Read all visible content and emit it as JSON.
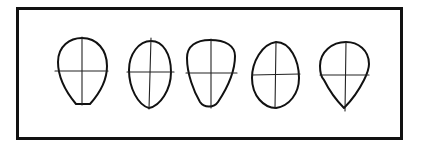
{
  "figure": {
    "frame_color": "#111111",
    "stroke_color": "#111111",
    "background": "#ffffff",
    "shapes": [
      {
        "index": 1,
        "name": "flat-bottom-oval",
        "label": "Oval with flat chin"
      },
      {
        "index": 2,
        "name": "egg-narrow-bottom",
        "label": "Egg shape (narrow chin)"
      },
      {
        "index": 3,
        "name": "rounded-trapezoid",
        "label": "Wide top, tapering bottom"
      },
      {
        "index": 4,
        "name": "egg-wide-bottom",
        "label": "Egg shape (wide middle)"
      },
      {
        "index": 5,
        "name": "teardrop",
        "label": "Round top, pointed chin"
      }
    ]
  }
}
